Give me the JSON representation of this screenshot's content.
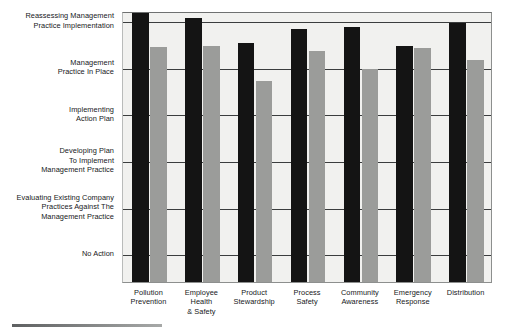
{
  "chart_data": {
    "type": "bar",
    "title": "",
    "xlabel": "",
    "ylabel": "",
    "grid": true,
    "legend": "none",
    "categories": [
      "Pollution\nPrevention",
      "Employee\nHealth\n& Safety",
      "Product\nStewardship",
      "Process\nSafety",
      "Community\nAwareness",
      "Emergency\nResponse",
      "Distribution"
    ],
    "ytick_labels": [
      "Reassessing Management\nPractice Implementation",
      "Management\nPractice In Place",
      "Implementing\nAction Plan",
      "Developing Plan\nTo Implement\nManagement Practice",
      "Evaluating Existing Company\nPractices Against The\nManagement Practice",
      "No Action"
    ],
    "ytick_values": [
      6,
      5,
      4,
      3,
      2,
      1
    ],
    "ylim": [
      0.38,
      6.2
    ],
    "series": [
      {
        "name": "series-dark",
        "color": "#141414",
        "values": [
          6.15,
          6.05,
          5.52,
          5.82,
          5.85,
          5.45,
          5.95
        ]
      },
      {
        "name": "series-light",
        "color": "#9b9c9a",
        "values": [
          5.42,
          5.45,
          4.7,
          5.35,
          4.95,
          5.4,
          5.15
        ]
      }
    ],
    "categories_flat": [
      "Pollution Prevention",
      "Employee Health & Safety",
      "Product Stewardship",
      "Process Safety",
      "Community Awareness",
      "Emergency Response",
      "Distribution"
    ]
  },
  "colors": {
    "plot_background": "#f1f1ef",
    "frame": "#8d8f8e",
    "gridline": "#3b3d3e",
    "text": "#16181a",
    "bar_dark": "#141414",
    "bar_light": "#9b9c9a"
  }
}
